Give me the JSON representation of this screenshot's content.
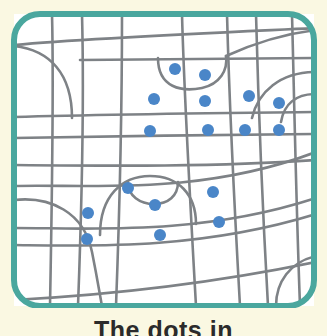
{
  "figure": {
    "kind": "street-map-illustration",
    "caption_text": "The dots in",
    "caption_note": "caption is cropped by the bottom edge of the image; only the upper portion of the letters is visible",
    "frame": {
      "shape": "rounded-rectangle",
      "color": "#4aa79e",
      "stroke_width_px": 6,
      "corner_radius_px": 26,
      "x": 14,
      "y": 14,
      "width": 300,
      "height": 292
    },
    "colors": {
      "map_background": "#ffffff",
      "page_background": "#faf8e2",
      "frame_teal": "#4aa79e",
      "road_gray": "#7e8286",
      "dot_blue": "#4a86c8",
      "dot_blue_edge": "#3a72b4",
      "caption_text": "#2b2b2b"
    },
    "dot_style": {
      "radius_px": 6,
      "count": 17,
      "meaning": "marked locations plotted on the street map"
    },
    "dots": [
      {
        "id": "dot-1",
        "x": 175,
        "y": 69
      },
      {
        "id": "dot-2",
        "x": 205,
        "y": 75
      },
      {
        "id": "dot-3",
        "x": 154,
        "y": 99
      },
      {
        "id": "dot-4",
        "x": 205,
        "y": 101
      },
      {
        "id": "dot-5",
        "x": 249,
        "y": 96
      },
      {
        "id": "dot-6",
        "x": 279,
        "y": 103
      },
      {
        "id": "dot-7",
        "x": 150,
        "y": 131
      },
      {
        "id": "dot-8",
        "x": 208,
        "y": 130
      },
      {
        "id": "dot-9",
        "x": 245,
        "y": 130
      },
      {
        "id": "dot-10",
        "x": 279,
        "y": 130
      },
      {
        "id": "dot-11",
        "x": 128,
        "y": 188
      },
      {
        "id": "dot-12",
        "x": 155,
        "y": 205
      },
      {
        "id": "dot-13",
        "x": 213,
        "y": 192
      },
      {
        "id": "dot-14",
        "x": 88,
        "y": 213
      },
      {
        "id": "dot-15",
        "x": 219,
        "y": 222
      },
      {
        "id": "dot-16",
        "x": 160,
        "y": 235
      },
      {
        "id": "dot-17",
        "x": 87,
        "y": 239
      }
    ],
    "roads": {
      "description": "irregular grid of gray streets with several curved arcs",
      "horizontal_count": 7,
      "vertical_count": 7,
      "curve_count": 6
    }
  }
}
